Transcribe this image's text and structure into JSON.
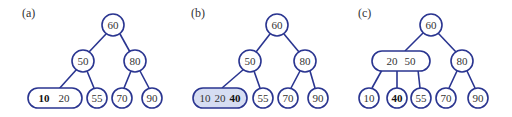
{
  "colors": {
    "edge": "#2a3590",
    "highlight_fill": "#d6ddf2",
    "text": "#333333"
  },
  "panels": [
    {
      "label": "(a)",
      "root": "60",
      "left": "50",
      "right": "80",
      "leaf_pill": {
        "keys": [
          "10",
          "20"
        ],
        "bold_index": 0
      },
      "leaves": [
        "55",
        "70",
        "90"
      ]
    },
    {
      "label": "(b)",
      "root": "60",
      "left": "50",
      "right": "80",
      "leaf_pill": {
        "keys": [
          "10",
          "20",
          "40"
        ],
        "bold_index": 2,
        "highlighted": true
      },
      "leaves": [
        "55",
        "70",
        "90"
      ]
    },
    {
      "label": "(c)",
      "root": "60",
      "left_pill": {
        "keys": [
          "20",
          "50"
        ]
      },
      "right": "80",
      "leaves": [
        "10",
        "40",
        "55",
        "70",
        "90"
      ],
      "bold_leaf_index": 1
    }
  ]
}
